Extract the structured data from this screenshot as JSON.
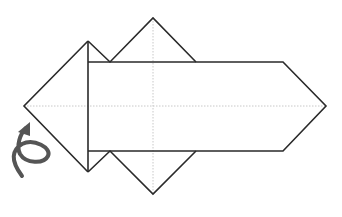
{
  "diagram": {
    "type": "origami-fold-step",
    "description": "Origami step: a square base with a long pointed strip laid across it; turn the model over",
    "colors": {
      "background": "#ffffff",
      "line": "#2a2a2a",
      "crease": "#c8c8c8",
      "arrow": "#555555"
    },
    "stroke_width": 1.6,
    "shapes": {
      "left_triangle": {
        "points": [
          [
            24,
            106
          ],
          [
            88,
            41
          ],
          [
            88,
            172
          ]
        ]
      },
      "diamond": {
        "top": [
          153,
          18
        ],
        "left_notch_top": [
          110,
          62
        ],
        "right_top": [
          196,
          62
        ],
        "right_bottom": [
          196,
          151
        ],
        "bottom": [
          153,
          194
        ],
        "left_notch_bottom": [
          110,
          151
        ]
      },
      "strip": {
        "left_x": 88,
        "top_y": 62,
        "bottom_y": 151,
        "shoulder_x": 283,
        "tip": [
          326,
          106
        ]
      }
    },
    "creases": {
      "horizontal": {
        "y": 106,
        "x1": 24,
        "x2": 326
      },
      "vertical": {
        "x": 153,
        "y1": 18,
        "y2": 194
      }
    },
    "arrow": {
      "name": "turn-over-arrow",
      "meaning": "Turn the model over"
    }
  }
}
